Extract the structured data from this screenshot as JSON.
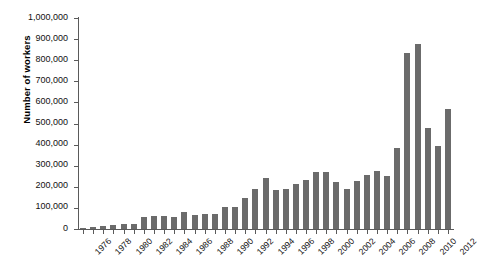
{
  "chart_data": {
    "type": "bar",
    "title": "",
    "xlabel": "",
    "ylabel": "Number of workers",
    "ylim": [
      0,
      1000000
    ],
    "ytick_values": [
      0,
      100000,
      200000,
      300000,
      400000,
      500000,
      600000,
      700000,
      800000,
      900000,
      1000000
    ],
    "ytick_labels": [
      "0",
      "100,000",
      "200,000",
      "300,000",
      "400,000",
      "500,000",
      "600,000",
      "700,000",
      "800,000",
      "900,000",
      "1,000,000"
    ],
    "grid": false,
    "legend": null,
    "bar_color": "#6b6b6b",
    "axis_color": "#5a5a5a",
    "categories": [
      "1976",
      "1977",
      "1978",
      "1979",
      "1980",
      "1981",
      "1982",
      "1983",
      "1984",
      "1985",
      "1986",
      "1987",
      "1988",
      "1989",
      "1990",
      "1991",
      "1992",
      "1993",
      "1994",
      "1995",
      "1996",
      "1997",
      "1998",
      "1999",
      "2000",
      "2001",
      "2002",
      "2003",
      "2004",
      "2005",
      "2006",
      "2007",
      "2008",
      "2009",
      "2010",
      "2011",
      "2012"
    ],
    "values": [
      3000,
      11000,
      16000,
      18000,
      22000,
      26000,
      55000,
      62000,
      60000,
      57000,
      80000,
      68000,
      73000,
      69000,
      102000,
      105000,
      148000,
      190000,
      244000,
      187000,
      189000,
      211000,
      231000,
      268000,
      269000,
      224000,
      191000,
      226000,
      256000,
      275000,
      253000,
      383000,
      833000,
      876000,
      478000,
      392000,
      569000
    ],
    "xtick_labeled": [
      "1976",
      "1978",
      "1980",
      "1982",
      "1984",
      "1986",
      "1988",
      "1990",
      "1992",
      "1994",
      "1996",
      "1998",
      "2000",
      "2002",
      "2004",
      "2006",
      "2008",
      "2010",
      "2012"
    ]
  }
}
